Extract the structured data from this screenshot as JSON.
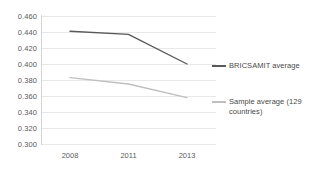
{
  "chart_data": {
    "type": "line",
    "title": "",
    "xlabel": "",
    "ylabel": "",
    "categories": [
      "2008",
      "2011",
      "2013"
    ],
    "ylim": [
      0.3,
      0.46
    ],
    "ytick_step": 0.02,
    "ytick_labels": [
      "0.460",
      "0.440",
      "0.420",
      "0.400",
      "0.380",
      "0.360",
      "0.340",
      "0.320",
      "0.300"
    ],
    "ytick_values": [
      0.46,
      0.44,
      0.42,
      0.4,
      0.38,
      0.36,
      0.34,
      0.32,
      0.3
    ],
    "grid": true,
    "legend_position": "right",
    "series": [
      {
        "name": "BRICSAMIT average",
        "color": "#595959",
        "values": [
          0.441,
          0.437,
          0.4
        ]
      },
      {
        "name": "Sample average (129 countries)",
        "color": "#bfbfbf",
        "values": [
          0.383,
          0.375,
          0.358
        ]
      }
    ]
  },
  "legend": {
    "items": [
      {
        "label": "BRICSAMIT average",
        "color": "#595959"
      },
      {
        "label": "Sample average (129 countries)",
        "color": "#bfbfbf"
      }
    ]
  },
  "colors": {
    "series_dark": "#595959",
    "series_light": "#bfbfbf",
    "gridline": "#e8e8e8",
    "axis": "#d4d4d4",
    "tick_text": "#5a5a5a"
  }
}
